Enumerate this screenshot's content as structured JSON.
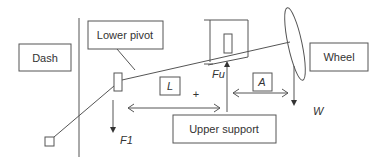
{
  "diagram": {
    "title": "",
    "labels": {
      "dash": "Dash",
      "lower_pivot": "Lower pivot",
      "wheel": "Wheel",
      "upper_support": "Upper support"
    },
    "symbols": {
      "L": "L",
      "A": "A",
      "Fu": "Fu",
      "F1": "F1",
      "W": "W",
      "plus": "+"
    },
    "colors": {
      "stroke": "#555555",
      "text": "#333333",
      "background": "#ffffff"
    }
  }
}
